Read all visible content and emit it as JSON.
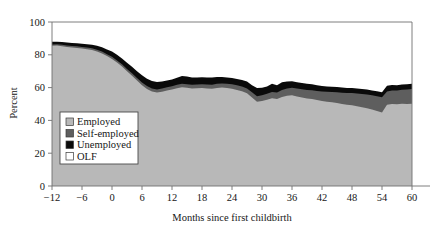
{
  "chart_data": {
    "type": "area",
    "title": "",
    "subtitle": "",
    "xlabel": "Months since first childbirth",
    "ylabel": "Percent",
    "stacked": true,
    "stack_total": 100,
    "grid": false,
    "gridlines": [
      100
    ],
    "xlim": [
      -12,
      60
    ],
    "ylim": [
      0,
      100
    ],
    "xticks": [
      -12,
      -6,
      0,
      6,
      12,
      18,
      24,
      30,
      36,
      42,
      48,
      54,
      60
    ],
    "xtick_labels": [
      "−12",
      "−6",
      "0",
      "6",
      "12",
      "18",
      "24",
      "30",
      "36",
      "42",
      "48",
      "54",
      "60"
    ],
    "yticks": [
      0,
      20,
      40,
      60,
      80,
      100
    ],
    "ytick_labels": [
      "0",
      "20",
      "40",
      "60",
      "80",
      "100"
    ],
    "legend_position": "lower-left",
    "legend": [
      "Employed",
      "Self-employed",
      "Unemployed",
      "OLF"
    ],
    "colors": {
      "employed": "#b8b8b8",
      "self_employed": "#5e5e5e",
      "unemployed": "#0a0a0a",
      "olf": "#ffffff",
      "axis": "#707070",
      "text": "#161616",
      "legend_border": "#4a4a4a"
    },
    "x": [
      -12,
      -11,
      -10,
      -9,
      -8,
      -7,
      -6,
      -5,
      -4,
      -3,
      -2,
      -1,
      0,
      1,
      2,
      3,
      4,
      5,
      6,
      7,
      8,
      9,
      10,
      11,
      12,
      13,
      14,
      15,
      16,
      17,
      18,
      19,
      20,
      21,
      22,
      23,
      24,
      25,
      26,
      27,
      28,
      29,
      30,
      31,
      32,
      33,
      34,
      35,
      36,
      37,
      38,
      39,
      40,
      41,
      42,
      43,
      44,
      45,
      46,
      47,
      48,
      49,
      50,
      51,
      52,
      53,
      54,
      55,
      56,
      57,
      58,
      59,
      60
    ],
    "series": [
      {
        "name": "Employed",
        "key": "employed",
        "values": [
          85.5,
          85.6,
          85.2,
          84.8,
          84.5,
          84.2,
          83.8,
          83.4,
          82.9,
          82.0,
          80.8,
          79.2,
          77.5,
          75.3,
          72.8,
          70.0,
          67.2,
          64.3,
          61.5,
          59.2,
          57.6,
          57.0,
          57.5,
          58.2,
          58.8,
          59.6,
          60.2,
          59.9,
          59.5,
          59.6,
          59.8,
          59.5,
          59.3,
          59.8,
          60.0,
          59.7,
          59.3,
          58.6,
          57.8,
          56.5,
          54.0,
          51.4,
          51.8,
          52.6,
          53.5,
          53.0,
          54.3,
          55.0,
          55.3,
          54.6,
          54.0,
          53.4,
          53.0,
          52.4,
          51.8,
          51.4,
          51.0,
          50.6,
          50.0,
          49.5,
          49.2,
          48.6,
          48.0,
          47.4,
          46.6,
          45.8,
          44.8,
          49.6,
          50.0,
          49.8,
          50.1,
          50.0,
          50.2
        ]
      },
      {
        "name": "Self-employed",
        "key": "self_employed",
        "values": [
          0.8,
          0.8,
          0.9,
          0.9,
          0.9,
          1.0,
          1.0,
          1.0,
          1.1,
          1.1,
          1.2,
          1.2,
          1.3,
          1.3,
          1.4,
          1.4,
          1.5,
          1.5,
          1.6,
          1.7,
          1.8,
          1.9,
          1.9,
          2.0,
          2.0,
          2.1,
          2.1,
          2.2,
          2.2,
          2.3,
          2.3,
          2.4,
          2.4,
          2.5,
          2.5,
          2.6,
          2.7,
          2.8,
          2.9,
          3.0,
          3.1,
          3.3,
          3.5,
          3.6,
          3.8,
          4.0,
          4.2,
          4.4,
          4.6,
          4.8,
          5.0,
          5.2,
          5.4,
          5.6,
          5.8,
          6.0,
          6.3,
          6.6,
          6.9,
          7.2,
          7.5,
          7.8,
          8.1,
          8.4,
          8.7,
          9.0,
          9.3,
          8.0,
          8.2,
          8.4,
          8.6,
          8.8,
          9.0
        ]
      },
      {
        "name": "Unemployed",
        "key": "unemployed",
        "values": [
          1.7,
          1.6,
          1.7,
          1.8,
          1.8,
          1.9,
          2.0,
          2.1,
          2.2,
          2.4,
          2.6,
          2.9,
          3.2,
          3.4,
          3.6,
          3.8,
          4.0,
          4.2,
          4.4,
          4.5,
          4.6,
          4.5,
          4.3,
          4.2,
          4.2,
          4.3,
          4.8,
          4.6,
          4.4,
          4.3,
          4.2,
          4.3,
          4.4,
          4.2,
          4.0,
          3.9,
          3.8,
          3.9,
          4.0,
          4.2,
          4.4,
          5.0,
          4.6,
          4.4,
          5.0,
          4.4,
          4.8,
          4.3,
          4.0,
          3.9,
          3.8,
          3.7,
          3.6,
          3.5,
          3.4,
          3.3,
          3.2,
          3.2,
          3.2,
          3.1,
          3.1,
          3.0,
          3.0,
          3.0,
          3.0,
          3.0,
          3.0,
          3.6,
          3.4,
          3.3,
          3.2,
          3.2,
          3.1
        ]
      },
      {
        "name": "OLF",
        "key": "olf",
        "values": [
          12.0,
          12.0,
          12.2,
          12.5,
          12.8,
          12.9,
          13.2,
          13.5,
          13.8,
          14.5,
          15.4,
          16.7,
          18.0,
          20.0,
          22.2,
          24.8,
          27.3,
          30.0,
          32.5,
          34.6,
          36.0,
          36.6,
          36.3,
          35.6,
          35.0,
          34.0,
          32.9,
          33.3,
          33.9,
          33.8,
          33.7,
          33.8,
          33.9,
          33.5,
          33.5,
          33.8,
          34.2,
          34.7,
          35.3,
          36.3,
          38.5,
          40.3,
          40.1,
          39.4,
          37.7,
          38.6,
          36.7,
          36.3,
          36.1,
          36.7,
          37.2,
          37.7,
          38.0,
          38.5,
          39.0,
          39.3,
          39.5,
          39.6,
          39.9,
          40.2,
          40.2,
          40.6,
          40.9,
          41.2,
          41.7,
          42.2,
          42.9,
          38.8,
          38.4,
          38.5,
          38.1,
          38.0,
          37.7
        ]
      }
    ]
  },
  "axes": {
    "ylabel_text": "Percent",
    "xlabel_text": "Months since first childbirth"
  },
  "legend": {
    "items": [
      {
        "label": "Employed",
        "key": "employed"
      },
      {
        "label": "Self-employed",
        "key": "self_employed"
      },
      {
        "label": "Unemployed",
        "key": "unemployed"
      },
      {
        "label": "OLF",
        "key": "olf"
      }
    ]
  }
}
